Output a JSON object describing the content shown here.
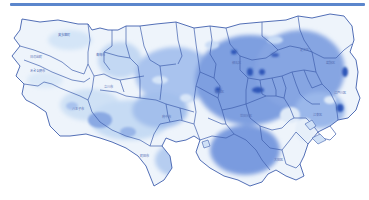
{
  "header": {
    "rule_color": "#5b86cc"
  },
  "map": {
    "subject": "Tokyo municipalities map",
    "colors": {
      "outline": "#3f5fae",
      "background": "#ffffff",
      "light": "#cfe1f5",
      "medium": "#8fb0e6",
      "strong": "#6f93dc",
      "dark": "#2f56b8"
    },
    "labels": [
      {
        "text": "奥多摩町",
        "x": 58,
        "y": 36
      },
      {
        "text": "日の出町",
        "x": 36,
        "y": 58
      },
      {
        "text": "あきる野市",
        "x": 36,
        "y": 71
      },
      {
        "text": "八王子市",
        "x": 78,
        "y": 110
      },
      {
        "text": "町田市",
        "x": 142,
        "y": 157
      },
      {
        "text": "青梅市",
        "x": 96,
        "y": 57
      },
      {
        "text": "立川市",
        "x": 108,
        "y": 88
      },
      {
        "text": "練馬区",
        "x": 235,
        "y": 64
      },
      {
        "text": "足立区",
        "x": 303,
        "y": 51
      },
      {
        "text": "葛飾区",
        "x": 328,
        "y": 64
      },
      {
        "text": "江戸川区",
        "x": 340,
        "y": 94
      },
      {
        "text": "江東区",
        "x": 315,
        "y": 118
      },
      {
        "text": "大田区",
        "x": 277,
        "y": 161
      },
      {
        "text": "世田谷区",
        "x": 244,
        "y": 117
      },
      {
        "text": "杉並区",
        "x": 218,
        "y": 93
      },
      {
        "text": "府中市",
        "x": 167,
        "y": 118
      }
    ]
  }
}
